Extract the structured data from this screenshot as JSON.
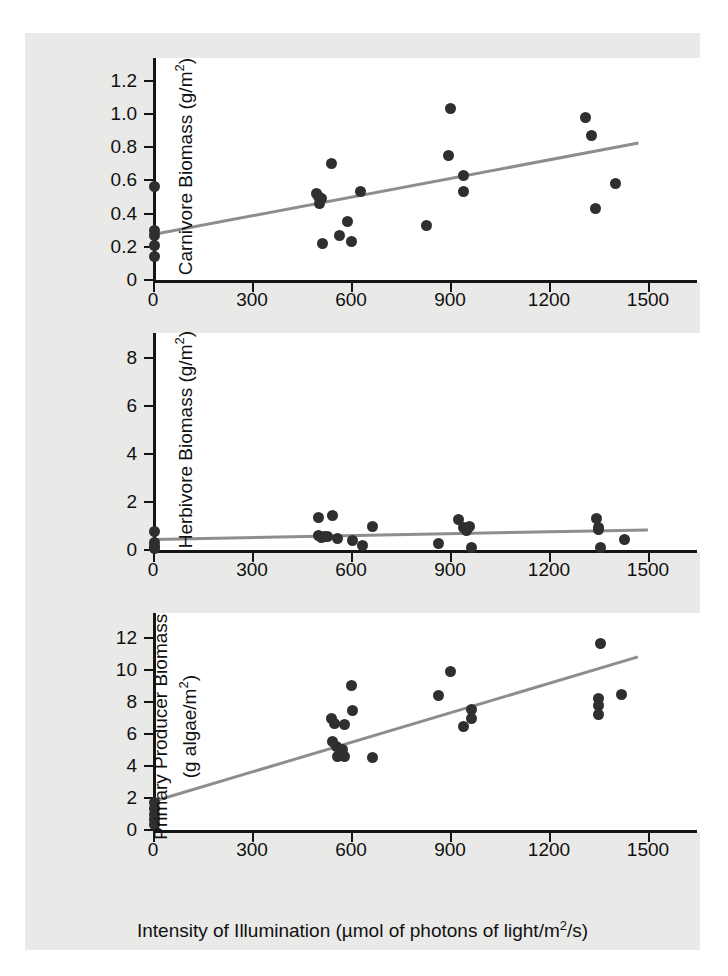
{
  "figure": {
    "background_color": "#e9e9e7",
    "plot_background_color": "#ffffff",
    "axis_color": "#151515",
    "marker_color": "#2f2f2f",
    "trendline_color": "#8d8d8d",
    "x_axis_title": "Intensity of Illumination (µmol of photons of light/m²/s)",
    "x_title_parts": {
      "before": "Intensity of Illumination (µmol of photons of light/m",
      "sup": "2",
      "after": "/s)"
    },
    "shared_x_ticks": [
      "0",
      "300",
      "600",
      "900",
      "1200",
      "1500"
    ]
  },
  "chart_data": [
    {
      "type": "scatter",
      "title": "",
      "panel": "carnivore",
      "xlabel": "Intensity of Illumination (µmol of photons of light/m2/s)",
      "ylabel": "Carnivore Biomass (g/m2)",
      "ylabel_parts": {
        "text": "Carnivore Biomass (g/m",
        "sup": "2",
        "tail": ")"
      },
      "xlim": [
        0,
        1500
      ],
      "ylim": [
        0,
        1.3
      ],
      "xticks": [
        0,
        300,
        600,
        900,
        1200,
        1500
      ],
      "xticklabels": [
        "0",
        "300",
        "600",
        "900",
        "1200",
        "1500"
      ],
      "yticks": [
        0,
        0.2,
        0.4,
        0.6,
        0.8,
        1.0,
        1.2
      ],
      "yticklabels": [
        "0",
        "0.2",
        "0.4",
        "0.6",
        "0.8",
        "1.0",
        "1.2"
      ],
      "grid": false,
      "legend": "none",
      "points": [
        {
          "x": 5,
          "y": 0.56
        },
        {
          "x": 5,
          "y": 0.3
        },
        {
          "x": 5,
          "y": 0.27
        },
        {
          "x": 5,
          "y": 0.21
        },
        {
          "x": 5,
          "y": 0.14
        },
        {
          "x": 495,
          "y": 0.52
        },
        {
          "x": 500,
          "y": 0.5
        },
        {
          "x": 510,
          "y": 0.49
        },
        {
          "x": 505,
          "y": 0.46
        },
        {
          "x": 515,
          "y": 0.22
        },
        {
          "x": 540,
          "y": 0.7
        },
        {
          "x": 565,
          "y": 0.27
        },
        {
          "x": 590,
          "y": 0.35
        },
        {
          "x": 600,
          "y": 0.23
        },
        {
          "x": 630,
          "y": 0.53
        },
        {
          "x": 830,
          "y": 0.33
        },
        {
          "x": 900,
          "y": 1.03
        },
        {
          "x": 895,
          "y": 0.75
        },
        {
          "x": 940,
          "y": 0.63
        },
        {
          "x": 940,
          "y": 0.53
        },
        {
          "x": 1310,
          "y": 0.98
        },
        {
          "x": 1330,
          "y": 0.87
        },
        {
          "x": 1340,
          "y": 0.43
        },
        {
          "x": 1400,
          "y": 0.58
        }
      ],
      "trendline": {
        "x0": 0,
        "y0": 0.275,
        "x1": 1470,
        "y1": 0.825
      }
    },
    {
      "type": "scatter",
      "title": "",
      "panel": "herbivore",
      "xlabel": "Intensity of Illumination (µmol of photons of light/m2/s)",
      "ylabel": "Herbivore Biomass (g/m2)",
      "ylabel_parts": {
        "text": "Herbivore Biomass (g/m",
        "sup": "2",
        "tail": ")"
      },
      "xlim": [
        0,
        1500
      ],
      "ylim": [
        0,
        8.8
      ],
      "xticks": [
        0,
        300,
        600,
        900,
        1200,
        1500
      ],
      "xticklabels": [
        "0",
        "300",
        "600",
        "900",
        "1200",
        "1500"
      ],
      "yticks": [
        0,
        2,
        4,
        6,
        8
      ],
      "yticklabels": [
        "0",
        "2",
        "4",
        "6",
        "8"
      ],
      "grid": false,
      "legend": "none",
      "points": [
        {
          "x": 5,
          "y": 0.78
        },
        {
          "x": 5,
          "y": 0.3
        },
        {
          "x": 5,
          "y": 0.15
        },
        {
          "x": 5,
          "y": 0.05
        },
        {
          "x": 500,
          "y": 1.35
        },
        {
          "x": 500,
          "y": 0.62
        },
        {
          "x": 510,
          "y": 0.52
        },
        {
          "x": 520,
          "y": 0.58
        },
        {
          "x": 530,
          "y": 0.55
        },
        {
          "x": 545,
          "y": 1.42
        },
        {
          "x": 560,
          "y": 0.5
        },
        {
          "x": 605,
          "y": 0.4
        },
        {
          "x": 635,
          "y": 0.18
        },
        {
          "x": 665,
          "y": 1.0
        },
        {
          "x": 865,
          "y": 0.28
        },
        {
          "x": 925,
          "y": 1.28
        },
        {
          "x": 940,
          "y": 0.95
        },
        {
          "x": 950,
          "y": 0.8
        },
        {
          "x": 960,
          "y": 1.0
        },
        {
          "x": 965,
          "y": 0.1
        },
        {
          "x": 1345,
          "y": 1.3
        },
        {
          "x": 1350,
          "y": 0.95
        },
        {
          "x": 1350,
          "y": 0.85
        },
        {
          "x": 1355,
          "y": 0.1
        },
        {
          "x": 1430,
          "y": 0.45
        }
      ],
      "trendline": {
        "x0": 0,
        "y0": 0.42,
        "x1": 1500,
        "y1": 0.82
      }
    },
    {
      "type": "scatter",
      "title": "",
      "panel": "primary-producer",
      "xlabel": "Intensity of Illumination (µmol of photons of light/m2/s)",
      "ylabel": "Primary Producer Biomass (g algae/m2)",
      "ylabel_line1": "Primary Producer Biomass",
      "ylabel_line2_parts": {
        "text": "(g algae/m",
        "sup": "2",
        "tail": ")"
      },
      "xlim": [
        0,
        1500
      ],
      "ylim": [
        0,
        13.2
      ],
      "xticks": [
        0,
        300,
        600,
        900,
        1200,
        1500
      ],
      "xticklabels": [
        "0",
        "300",
        "600",
        "900",
        "1200",
        "1500"
      ],
      "yticks": [
        0,
        2,
        4,
        6,
        8,
        10,
        12
      ],
      "yticklabels": [
        "0",
        "2",
        "4",
        "6",
        "8",
        "10",
        "12"
      ],
      "grid": false,
      "legend": "none",
      "points": [
        {
          "x": 5,
          "y": 1.7
        },
        {
          "x": 5,
          "y": 1.35
        },
        {
          "x": 5,
          "y": 1.0
        },
        {
          "x": 5,
          "y": 0.65
        },
        {
          "x": 5,
          "y": 0.35
        },
        {
          "x": 540,
          "y": 7.0
        },
        {
          "x": 545,
          "y": 5.55
        },
        {
          "x": 550,
          "y": 6.65
        },
        {
          "x": 555,
          "y": 5.2
        },
        {
          "x": 560,
          "y": 4.6
        },
        {
          "x": 575,
          "y": 5.05
        },
        {
          "x": 580,
          "y": 4.6
        },
        {
          "x": 580,
          "y": 6.6
        },
        {
          "x": 600,
          "y": 9.05
        },
        {
          "x": 605,
          "y": 7.5
        },
        {
          "x": 665,
          "y": 4.55
        },
        {
          "x": 865,
          "y": 8.4
        },
        {
          "x": 900,
          "y": 9.9
        },
        {
          "x": 940,
          "y": 6.45
        },
        {
          "x": 965,
          "y": 7.55
        },
        {
          "x": 965,
          "y": 7.0
        },
        {
          "x": 1355,
          "y": 11.65
        },
        {
          "x": 1350,
          "y": 8.2
        },
        {
          "x": 1350,
          "y": 7.8
        },
        {
          "x": 1350,
          "y": 7.2
        },
        {
          "x": 1420,
          "y": 8.5
        }
      ],
      "trendline": {
        "x0": 0,
        "y0": 1.8,
        "x1": 1470,
        "y1": 10.85
      }
    }
  ]
}
